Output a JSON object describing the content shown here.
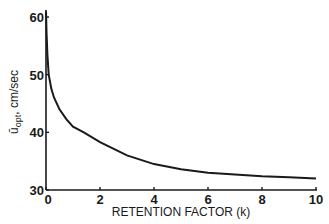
{
  "chart_data": {
    "type": "line",
    "title": "",
    "xlabel": "RETENTION FACTOR (k)",
    "ylabel": "ū_opt, cm/sec",
    "ylabel_parts": {
      "symbol": "ū",
      "subscript": "opt",
      "units": ", cm/sec"
    },
    "xlim": [
      0,
      10
    ],
    "ylim": [
      30,
      61
    ],
    "x_ticks": [
      0,
      2,
      4,
      6,
      8,
      10
    ],
    "x_tick_labels": [
      "0",
      "2",
      "4",
      "6",
      "8",
      "10"
    ],
    "y_ticks": [
      30,
      40,
      50,
      60
    ],
    "y_tick_labels": [
      "30",
      "40",
      "50",
      "60"
    ],
    "grid": false,
    "legend": null,
    "series": [
      {
        "name": "optimum velocity",
        "x": [
          0.0,
          0.02,
          0.05,
          0.1,
          0.2,
          0.3,
          0.5,
          0.75,
          1.0,
          1.4,
          2.0,
          3.0,
          4.0,
          5.0,
          6.0,
          7.0,
          8.0,
          9.0,
          10.0
        ],
        "values": [
          61.0,
          57.5,
          53.5,
          50.0,
          47.5,
          46.0,
          44.0,
          42.3,
          41.0,
          40.0,
          38.3,
          36.0,
          34.5,
          33.6,
          33.0,
          32.7,
          32.4,
          32.2,
          32.0
        ]
      }
    ],
    "line_color": "#1a1a1a"
  }
}
